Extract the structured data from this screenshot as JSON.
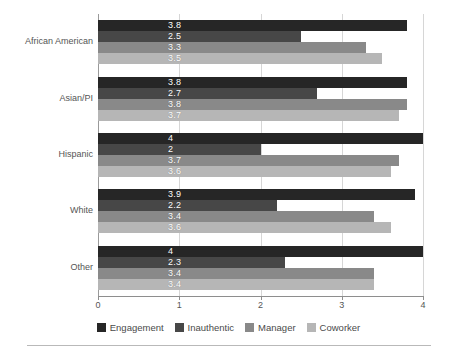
{
  "chart_data": {
    "type": "bar",
    "orientation": "horizontal",
    "title": "",
    "subtitle": "",
    "xlabel": "",
    "ylabel": "",
    "xlim": [
      0,
      4
    ],
    "x_ticks": [
      "0",
      "1",
      "2",
      "3",
      "4"
    ],
    "grid": true,
    "grid_axis": "x",
    "legend_position": "bottom",
    "categories": [
      "African American",
      "Asian/PI",
      "Hispanic",
      "White",
      "Other"
    ],
    "series": [
      {
        "name": "Engagement",
        "color": "#262626",
        "values": [
          3.8,
          3.8,
          4,
          3.9,
          4
        ],
        "labels": [
          "3.8",
          "3.8",
          "4",
          "3.9",
          "4"
        ]
      },
      {
        "name": "Inauthentic",
        "color": "#474747",
        "values": [
          2.5,
          2.7,
          2,
          2.2,
          2.3
        ],
        "labels": [
          "2.5",
          "2.7",
          "2",
          "2.2",
          "2.3"
        ]
      },
      {
        "name": "Manager",
        "color": "#898989",
        "values": [
          3.3,
          3.8,
          3.7,
          3.4,
          3.4
        ],
        "labels": [
          "3.3",
          "3.8",
          "3.7",
          "3.4",
          "3.4"
        ]
      },
      {
        "name": "Coworker",
        "color": "#b6b6b6",
        "values": [
          3.5,
          3.7,
          3.6,
          3.6,
          3.4
        ],
        "labels": [
          "3.5",
          "3.7",
          "3.6",
          "3.6",
          "3.4"
        ]
      }
    ]
  },
  "legend": {
    "items": [
      {
        "label": "Engagement",
        "color": "#262626"
      },
      {
        "label": "Inauthentic",
        "color": "#474747"
      },
      {
        "label": "Manager",
        "color": "#898989"
      },
      {
        "label": "Coworker",
        "color": "#b6b6b6"
      }
    ]
  }
}
